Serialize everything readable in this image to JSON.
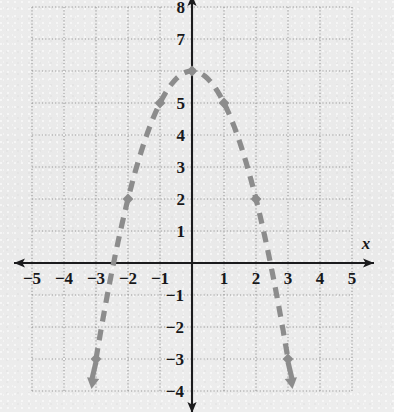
{
  "chart_data": {
    "type": "line",
    "title": "",
    "xlabel": "x",
    "ylabel": "",
    "xlim": [
      -5,
      5
    ],
    "ylim": [
      -4,
      8
    ],
    "grid": true,
    "legend": null,
    "x_ticks": [
      "-5",
      "-4",
      "-3",
      "-2",
      "-1",
      "1",
      "2",
      "3",
      "4",
      "5"
    ],
    "y_ticks": [
      "8",
      "7",
      "5",
      "4",
      "3",
      "2",
      "1",
      "-1",
      "-2",
      "-3",
      "-4"
    ],
    "series": [
      {
        "name": "parabola",
        "equation": "y = -x^2 + 6",
        "style": "dashed",
        "color": "#8c8c8c",
        "marker": "filled-diamond",
        "arrow_ends": "both-down",
        "points": [
          {
            "x": -3,
            "y": -3
          },
          {
            "x": -2,
            "y": 2
          },
          {
            "x": -1,
            "y": 5
          },
          {
            "x": 0,
            "y": 6
          },
          {
            "x": 1,
            "y": 5
          },
          {
            "x": 2,
            "y": 2
          },
          {
            "x": 3,
            "y": -3
          }
        ]
      }
    ],
    "grid_color": "#9a9a9a",
    "axis_color": "#1b1b1d",
    "background": "#ebebeb"
  },
  "axes": {
    "x_axis_label": "x",
    "x_tick_labels": [
      {
        "label": "-5",
        "value": -5
      },
      {
        "label": "-4",
        "value": -4
      },
      {
        "label": "-3",
        "value": -3
      },
      {
        "label": "-2",
        "value": -2
      },
      {
        "label": "-1",
        "value": -1
      },
      {
        "label": "1",
        "value": 1
      },
      {
        "label": "2",
        "value": 2
      },
      {
        "label": "3",
        "value": 3
      },
      {
        "label": "4",
        "value": 4
      },
      {
        "label": "5",
        "value": 5
      }
    ],
    "y_tick_labels": [
      {
        "label": "8",
        "value": 8
      },
      {
        "label": "7",
        "value": 7
      },
      {
        "label": "5",
        "value": 5
      },
      {
        "label": "4",
        "value": 4
      },
      {
        "label": "3",
        "value": 3
      },
      {
        "label": "2",
        "value": 2
      },
      {
        "label": "1",
        "value": 1
      },
      {
        "label": "-1",
        "value": -1
      },
      {
        "label": "-2",
        "value": -2
      },
      {
        "label": "-3",
        "value": -3
      },
      {
        "label": "-4",
        "value": -4
      }
    ]
  }
}
